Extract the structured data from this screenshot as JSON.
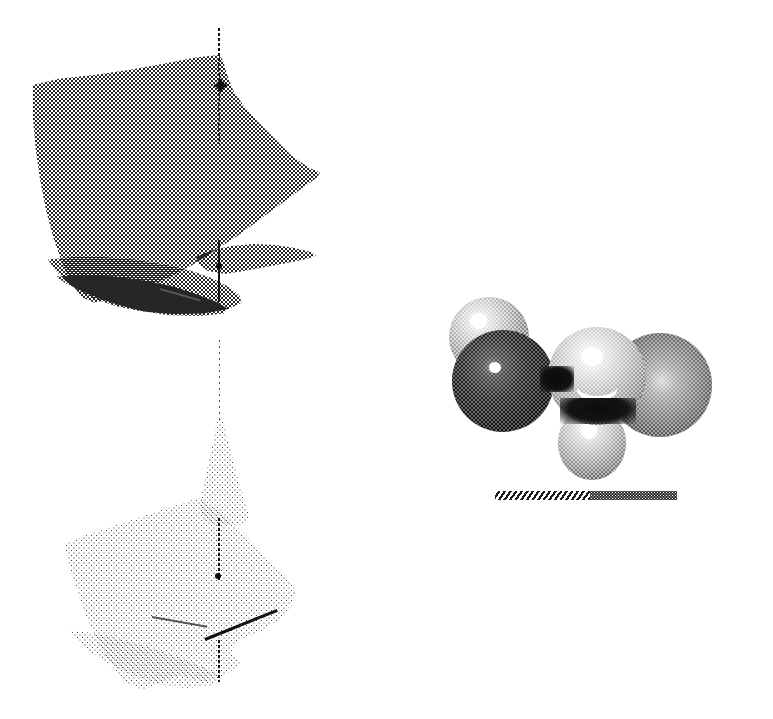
{
  "figure": {
    "kind": "scientific-illustration",
    "medium": "halftone-dithered print scan",
    "background_color": "#ffffff",
    "width_px": 773,
    "height_px": 719,
    "caption": "",
    "panels": [
      {
        "id": "left-panel",
        "name": "potential-energy-surface-stack",
        "description": "Three stacked dithered 3D surface sheets pierced by a common vertical axis",
        "axis": {
          "name": "vertical-axis",
          "style": "dotted",
          "color": "#111111",
          "top_y": 28,
          "bottom_y": 680,
          "x": 219
        },
        "sheets": [
          {
            "name": "upper-surface-sheet",
            "label": "",
            "shade": "medium-gray-halftone",
            "bbox": [
              33,
              60,
              313,
              300
            ],
            "marker": {
              "name": "node-point-upper",
              "x": 221,
              "y": 86,
              "style": "asterisk"
            }
          },
          {
            "name": "middle-surface-sheet",
            "label": "",
            "shade": "medium-gray-halftone",
            "bbox": [
              50,
              245,
              310,
              300
            ],
            "marker": {
              "name": "node-point-middle",
              "x": 219,
              "y": 266,
              "style": "dot"
            }
          },
          {
            "name": "lower-surface-sheet",
            "label": "",
            "shade": "light-gray-halftone",
            "bbox": [
              65,
              500,
              295,
              690
            ],
            "marker": {
              "name": "node-point-lower",
              "x": 218,
              "y": 576,
              "style": "dot"
            }
          }
        ],
        "vector": {
          "name": "bond-vector-line",
          "x1": 205,
          "y1": 638,
          "x2": 277,
          "y2": 609,
          "color": "#111111"
        }
      },
      {
        "id": "right-panel",
        "name": "molecular-orbital-space-filling-model",
        "description": "Five shaded spheres representing orbital lobes of a planar molecule",
        "spheres": [
          {
            "name": "lobe-upper-left",
            "cx": 489,
            "cy": 337,
            "r": 40,
            "tone": "light",
            "tone_hex": "#b9b9b9",
            "highlight": true
          },
          {
            "name": "lobe-lower-left",
            "cx": 503,
            "cy": 381,
            "r": 51,
            "tone": "dark",
            "tone_hex": "#1c1c1c",
            "highlight": true
          },
          {
            "name": "lobe-center",
            "cx": 597,
            "cy": 376,
            "r": 49,
            "tone": "light",
            "tone_hex": "#c2c2c2",
            "highlight": true
          },
          {
            "name": "lobe-bottom",
            "cx": 592,
            "cy": 440,
            "r": 34,
            "tone": "light",
            "tone_hex": "#bdbdbd",
            "highlight": true
          },
          {
            "name": "lobe-right",
            "cx": 660,
            "cy": 385,
            "r": 52,
            "tone": "medium",
            "tone_hex": "#6a6a6a",
            "highlight": true
          }
        ],
        "scale_bar": {
          "name": "scale-bar",
          "x": 495,
          "y": 491,
          "width": 182,
          "height": 9,
          "segments": [
            {
              "name": "scale-bar-hatched-segment",
              "fill": "diagonal-hatch",
              "fraction": 0.52
            },
            {
              "name": "scale-bar-solid-segment",
              "fill": "solid-dark",
              "fraction": 0.48
            }
          ]
        }
      }
    ],
    "colors": {
      "ink": "#1a1a1a",
      "mid_gray": "#6a6a6a",
      "light_gray": "#bdbdbd",
      "paper": "#ffffff"
    }
  }
}
